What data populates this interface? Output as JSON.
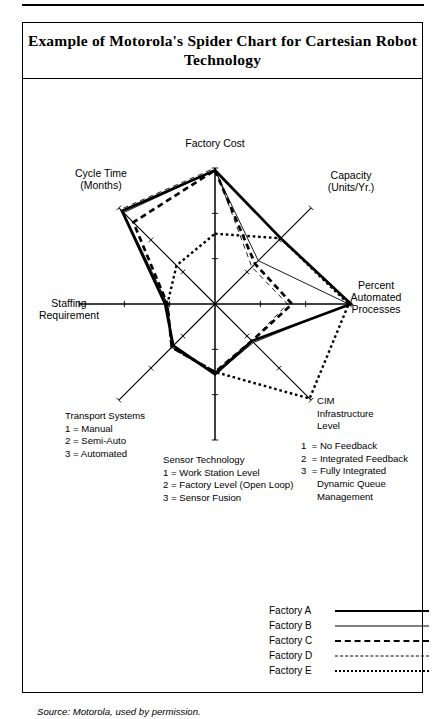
{
  "figure": {
    "title": "Example of Motorola's Spider Chart for\nCartesian Robot Technology",
    "source": "Source:  Motorola, used by permission."
  },
  "axis_captions": {
    "factory_cost": "Factory Cost",
    "capacity": "Capacity\n(Units/Yr.)",
    "percent_automated": "Percent\nAutomated\nProcesses",
    "cim": "CIM\nInfrastructure\nLevel",
    "sensor": "Sensor Technology",
    "transport": "Transport Systems",
    "staffing": "Staffing\nRequirement",
    "cycle_time": "Cycle Time\n(Months)"
  },
  "definitions": {
    "transport": "Transport Systems\n1 = Manual\n2 = Semi-Auto\n3 = Automated",
    "sensor": "Sensor Technology\n1 = Work Station Level\n2 = Factory Level (Open Loop)\n3 = Sensor Fusion",
    "cim_head": "CIM\nInfrastructure\nLevel",
    "cim_items": "1  = No Feedback\n2  = Integrated Feedback\n3  = Fully Integrated\n      Dynamic Queue\n      Management"
  },
  "legend": {
    "rows": [
      {
        "label": "Factory A",
        "style": "solid-thick"
      },
      {
        "label": "Factory B",
        "style": "solid-thin"
      },
      {
        "label": "Factory C",
        "style": "dashed-thick"
      },
      {
        "label": "Factory D",
        "style": "dashed-thin"
      },
      {
        "label": "Factory E",
        "style": "dotted"
      }
    ]
  },
  "chart_data": {
    "type": "radar",
    "title": "Example of Motorola's Spider Chart for Cartesian Robot Technology",
    "grid": false,
    "legend_position": "bottom-right",
    "axis_range": [
      0,
      3
    ],
    "axes": [
      {
        "key": "factory_cost",
        "label": "Factory Cost",
        "angle_deg": 90
      },
      {
        "key": "capacity",
        "label": "Capacity (Units/Yr.)",
        "angle_deg": 45
      },
      {
        "key": "percent_automated",
        "label": "Percent Automated Processes",
        "angle_deg": 0
      },
      {
        "key": "cim",
        "label": "CIM Infrastructure Level",
        "angle_deg": -45
      },
      {
        "key": "sensor",
        "label": "Sensor Technology",
        "angle_deg": -90
      },
      {
        "key": "transport",
        "label": "Transport Systems",
        "angle_deg": -135
      },
      {
        "key": "staffing",
        "label": "Staffing Requirement",
        "angle_deg": 180
      },
      {
        "key": "cycle_time",
        "label": "Cycle Time (Months)",
        "angle_deg": 135
      }
    ],
    "series": [
      {
        "name": "Factory A",
        "style": "solid-thick",
        "values": [
          2.95,
          2.05,
          3.0,
          1.15,
          1.55,
          1.3,
          1.1,
          2.9
        ]
      },
      {
        "name": "Factory B",
        "style": "solid-thin",
        "values": [
          2.95,
          1.35,
          2.95,
          1.2,
          1.55,
          1.35,
          1.05,
          2.85
        ]
      },
      {
        "name": "Factory C",
        "style": "dashed-thick",
        "values": [
          2.95,
          1.25,
          1.7,
          1.15,
          1.5,
          1.35,
          1.05,
          2.55
        ]
      },
      {
        "name": "Factory D",
        "style": "dashed-thin",
        "values": [
          3.0,
          1.15,
          1.6,
          1.15,
          1.5,
          1.35,
          1.05,
          2.95
        ]
      },
      {
        "name": "Factory E",
        "style": "dotted",
        "values": [
          1.55,
          2.05,
          2.95,
          2.95,
          1.5,
          1.35,
          1.05,
          1.2
        ]
      }
    ]
  }
}
